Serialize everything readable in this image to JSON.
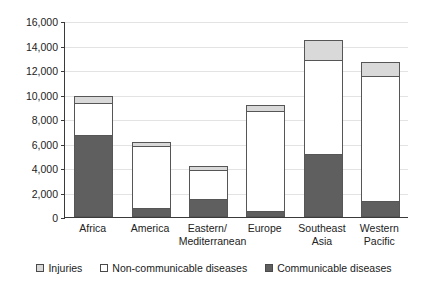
{
  "chart_data": {
    "type": "bar",
    "subtype": "stacked-vertical",
    "title": "",
    "xlabel": "",
    "ylabel": "",
    "ylim": [
      0,
      16000
    ],
    "ytick_step": 2000,
    "ytick_labels": [
      "16,000",
      "14,000",
      "12,000",
      "10,000",
      "8,000",
      "6,000",
      "4,000",
      "2,000",
      "0"
    ],
    "ytick_values": [
      16000,
      14000,
      12000,
      10000,
      8000,
      6000,
      4000,
      2000,
      0
    ],
    "grid": true,
    "grid_axis": "y",
    "legend_position": "bottom",
    "categories": [
      "Africa",
      "America",
      "Eastern/\nMediterranean",
      "Europe",
      "Southeast\nAsia",
      "Western\nPacific"
    ],
    "series": [
      {
        "name": "Communicable diseases",
        "color": "#5f5f5f",
        "values": [
          6700,
          700,
          1500,
          500,
          5150,
          1300
        ]
      },
      {
        "name": "Non-communicable diseases",
        "color": "#ffffff",
        "values": [
          2700,
          5200,
          2400,
          8200,
          7750,
          10300
        ]
      },
      {
        "name": "Injuries",
        "color": "#d9d9d9",
        "values": [
          650,
          350,
          400,
          600,
          1700,
          1200
        ]
      }
    ],
    "totals": [
      10050,
      6250,
      4300,
      9300,
      14600,
      12800
    ]
  },
  "legend": {
    "items": [
      {
        "label": "Injuries",
        "swatch_color": "#d9d9d9"
      },
      {
        "label": "Non-communicable diseases",
        "swatch_color": "#ffffff"
      },
      {
        "label": "Communicable diseases",
        "swatch_color": "#5f5f5f"
      }
    ]
  }
}
